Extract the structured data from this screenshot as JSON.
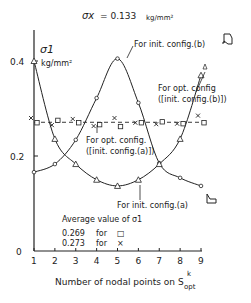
{
  "chart_data": {
    "type": "line",
    "title": "σx = 0.133 kg/mm²",
    "title_symbol": "σx",
    "title_value": "= 0.133",
    "title_unit": "kg/mm²",
    "xlabel": "Number of nodal points on S",
    "xlabel_sup": "k",
    "xlabel_sub": "opt",
    "ylabel": "σ1",
    "yunit": "kg/mm²",
    "x": [
      1,
      2,
      3,
      4,
      5,
      6,
      7,
      8,
      9
    ],
    "xticks": [
      "1",
      "2",
      "3",
      "4",
      "5",
      "6",
      "7",
      "8",
      "9"
    ],
    "yticks": [
      {
        "value": 0,
        "label": "0"
      },
      {
        "value": 0.2,
        "label": "0.2"
      },
      {
        "value": 0.4,
        "label": "0.4"
      }
    ],
    "ylim": [
      0,
      0.44
    ],
    "series": [
      {
        "name": "For init. config.(b)",
        "marker": "circle",
        "values": [
          0.166,
          0.183,
          0.234,
          0.322,
          0.405,
          0.312,
          0.185,
          0.154,
          0.137
        ]
      },
      {
        "name": "For init. config.(a)",
        "marker": "triangle",
        "values": [
          0.4,
          0.236,
          0.183,
          0.15,
          0.137,
          0.15,
          0.183,
          0.236,
          0.37
        ]
      },
      {
        "name": "For opt. config ([init. config.(a)])",
        "marker": "square",
        "values": [
          0.27,
          0.275,
          0.27,
          0.266,
          0.262,
          0.27,
          0.272,
          0.268,
          0.27
        ]
      },
      {
        "name": "For opt. config ([init. config.(b)])",
        "marker": "x",
        "values": [
          0.28,
          0.265,
          0.278,
          0.263,
          0.28,
          0.27,
          0.267,
          0.268,
          0.285
        ]
      }
    ],
    "reference_line": {
      "value": 0.271,
      "style": "dashed"
    },
    "annotations": {
      "init_b": "For init. config.(b)",
      "opt_b_line1": "For opt. config",
      "opt_b_line2": "([init. config.(b)])",
      "opt_a_line1": "For opt. config.",
      "opt_a_line2": "([init. config.(a)])",
      "init_a": "For init. config.(a)"
    },
    "legend": {
      "title": "Average value of σ1",
      "entries": [
        {
          "value": "0.269",
          "text": "for",
          "marker": "□"
        },
        {
          "value": "0.273",
          "text": "for",
          "marker": "×"
        }
      ]
    },
    "grid": false
  }
}
